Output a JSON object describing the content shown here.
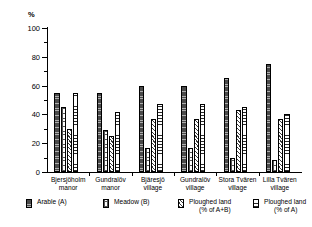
{
  "chart_data": {
    "type": "bar",
    "title": "",
    "subtitle": "",
    "xlabel": "",
    "ylabel": "%",
    "ylim": [
      0,
      100
    ],
    "yticks": [
      0,
      20,
      40,
      60,
      80,
      100
    ],
    "ytick_labels": [
      "0",
      "20",
      "40",
      "60",
      "80",
      "100"
    ],
    "minor_ticks": [
      10,
      30,
      50,
      70,
      90
    ],
    "grid": false,
    "legend_position": "bottom",
    "categories": [
      "Bjersjöholm manor",
      "Gundralöv manor",
      "Bjäresjö village",
      "Gundralöv village",
      "Stora Tvären village",
      "Lilla Tvären village"
    ],
    "category_lines": [
      [
        "Bjersjöholm",
        "manor"
      ],
      [
        "Gundralöv",
        "manor"
      ],
      [
        "Bjäresjö",
        "village"
      ],
      [
        "Gundralöv",
        "village"
      ],
      [
        "Stora Tvären",
        "village"
      ],
      [
        "Lilla Tvären",
        "village"
      ]
    ],
    "series": [
      {
        "name": "Arable (A)",
        "pattern": "solid",
        "values": [
          55,
          55,
          60,
          60,
          65,
          75
        ]
      },
      {
        "name": "Meadow (B)",
        "pattern": "dotgrid",
        "values": [
          45,
          29,
          17,
          17,
          10,
          8
        ]
      },
      {
        "name": "Ploughed land (% of A+B)",
        "pattern": "diag",
        "values": [
          30,
          25,
          37,
          37,
          43,
          37
        ]
      },
      {
        "name": "Ploughed land (% of A)",
        "pattern": "horiz",
        "values": [
          55,
          42,
          47,
          47,
          45,
          40
        ]
      }
    ]
  },
  "legend": {
    "items": [
      {
        "label": "Arable (A)",
        "line2": ""
      },
      {
        "label": "Meadow (B)",
        "line2": ""
      },
      {
        "label": "Ploughed land",
        "line2": "(% of A+B)"
      },
      {
        "label": "Ploughed land",
        "line2": "(% of A)"
      }
    ]
  },
  "axis": {
    "unit_symbol": "%"
  }
}
